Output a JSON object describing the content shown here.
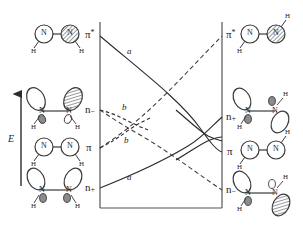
{
  "diagram": {
    "type": "orbital-correlation-diagram",
    "axis": {
      "energy_label": "E",
      "direction": "up"
    },
    "frame": {
      "x0": 100,
      "x1": 222,
      "y0": 22,
      "y1": 208
    },
    "left_levels": [
      {
        "key": "pi-star",
        "label": "π",
        "sup": "*",
        "sub": "",
        "y": 36
      },
      {
        "key": "n-minus",
        "label": "n",
        "sup": "",
        "sub": "−",
        "y": 110
      },
      {
        "key": "pi",
        "label": "π",
        "sup": "",
        "sub": "",
        "y": 148
      },
      {
        "key": "n-plus",
        "label": "n",
        "sup": "",
        "sub": "+",
        "y": 188
      }
    ],
    "right_levels": [
      {
        "key": "pi-star",
        "label": "π",
        "sup": "*",
        "sub": "",
        "y": 36
      },
      {
        "key": "n-plus",
        "label": "n",
        "sup": "",
        "sub": "+",
        "y": 117
      },
      {
        "key": "pi",
        "label": "π",
        "sup": "",
        "sub": "",
        "y": 152
      },
      {
        "key": "n-plus-low",
        "label": "n",
        "sup": "",
        "sub": "−",
        "y": 190
      }
    ],
    "curve_labels": [
      {
        "key": "a-upper",
        "text": "a",
        "x": 127,
        "y": 52
      },
      {
        "key": "b-upper",
        "text": "b",
        "x": 122,
        "y": 108
      },
      {
        "key": "b-lower",
        "text": "b",
        "x": 124,
        "y": 141
      },
      {
        "key": "a-lower",
        "text": "a",
        "x": 127,
        "y": 178
      }
    ],
    "correlations": [
      {
        "key": "sym-a-descending",
        "style": "solid",
        "from": "pi-star-left",
        "to": "pi-right"
      },
      {
        "key": "sym-a-ascending",
        "style": "solid",
        "from": "n-plus-left",
        "to": "n-plus-right"
      },
      {
        "key": "antisym-b-ascending",
        "style": "dashed",
        "from": "pi-left",
        "to": "pi-star-right"
      },
      {
        "key": "antisym-b-descending",
        "style": "dashed",
        "from": "n-minus-left",
        "to": "n-minus-right"
      }
    ],
    "molecules": {
      "left": [
        {
          "key": "pi-star-cis",
          "orbital": "π*",
          "atoms": [
            "N",
            "N"
          ],
          "hydrogens": [
            "H",
            "H"
          ],
          "geometry": "cis"
        },
        {
          "key": "n-minus-cis",
          "orbital": "n−",
          "atoms": [
            "N",
            "N"
          ],
          "hydrogens": [
            "H",
            "H"
          ],
          "geometry": "cis"
        },
        {
          "key": "pi-cis",
          "orbital": "π",
          "atoms": [
            "N",
            "N"
          ],
          "hydrogens": [
            "H",
            "H"
          ],
          "geometry": "cis"
        },
        {
          "key": "n-plus-cis",
          "orbital": "n+",
          "atoms": [
            "N",
            "N"
          ],
          "hydrogens": [
            "H",
            "H"
          ],
          "geometry": "cis"
        }
      ],
      "right": [
        {
          "key": "pi-star-trans",
          "orbital": "π*",
          "atoms": [
            "N",
            "N"
          ],
          "hydrogens": [
            "H",
            "H"
          ],
          "geometry": "trans"
        },
        {
          "key": "n-plus-trans",
          "orbital": "n+",
          "atoms": [
            "N",
            "N"
          ],
          "hydrogens": [
            "H",
            "H"
          ],
          "geometry": "trans"
        },
        {
          "key": "pi-trans",
          "orbital": "π",
          "atoms": [
            "N",
            "N"
          ],
          "hydrogens": [
            "H",
            "H"
          ],
          "geometry": "trans"
        },
        {
          "key": "n-minus-trans",
          "orbital": "n−",
          "atoms": [
            "N",
            "N"
          ],
          "hydrogens": [
            "H",
            "H"
          ],
          "geometry": "trans"
        }
      ]
    },
    "atom_symbol": "N",
    "hydrogen_symbol": "H",
    "colors": {
      "ink": "#2b2b2b",
      "line": "#3a3a3a",
      "shaded_lobe": "#8c8c8c",
      "empty_lobe": "#ffffff",
      "frame": "#555555"
    }
  }
}
